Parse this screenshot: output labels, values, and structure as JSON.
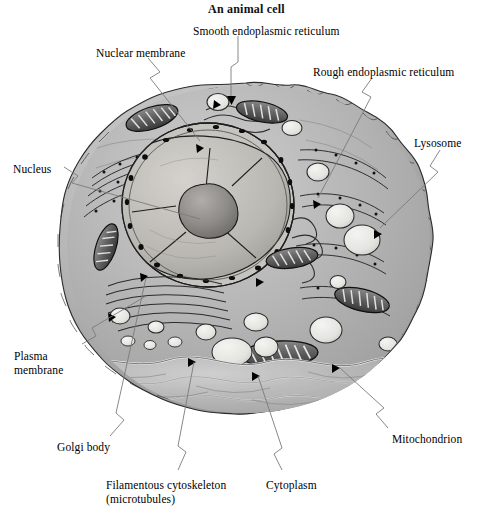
{
  "figure": {
    "title": "An animal cell",
    "style": "grayscale pen-and-ink cutaway illustration",
    "background_color": "#ffffff",
    "ink_color": "#000000",
    "leader_line_color": "#7b7b7b"
  },
  "labels": [
    {
      "id": "nuclear-membrane",
      "text": "Nuclear membrane",
      "lines": [
        "Nuclear membrane"
      ],
      "x": 96,
      "y": 47,
      "align": "left"
    },
    {
      "id": "smooth-er",
      "text": "Smooth endoplasmic reticulum",
      "lines": [
        "Smooth endoplasmic reticulum"
      ],
      "x": 193,
      "y": 25,
      "align": "left"
    },
    {
      "id": "rough-er",
      "text": "Rough endoplasmic reticulum",
      "lines": [
        "Rough endoplasmic reticulum"
      ],
      "x": 313,
      "y": 66,
      "align": "left"
    },
    {
      "id": "lysosome",
      "text": "Lysosome",
      "lines": [
        "Lysosome"
      ],
      "x": 414,
      "y": 137,
      "align": "left"
    },
    {
      "id": "nucleus",
      "text": "Nucleus",
      "lines": [
        "Nucleus"
      ],
      "x": 13,
      "y": 163,
      "align": "left"
    },
    {
      "id": "plasma-membrane",
      "text": "Plasma membrane",
      "lines": [
        "Plasma",
        "membrane"
      ],
      "x": 14,
      "y": 350,
      "align": "left"
    },
    {
      "id": "golgi-body",
      "text": "Golgi body",
      "lines": [
        "Golgi body"
      ],
      "x": 57,
      "y": 441,
      "align": "left"
    },
    {
      "id": "filamentous-cytoskeleton",
      "text": "Filamentous cytoskeleton (microtubules)",
      "lines": [
        "Filamentous cytoskeleton",
        "(microtubules)"
      ],
      "x": 106,
      "y": 479,
      "align": "left"
    },
    {
      "id": "cytoplasm",
      "text": "Cytoplasm",
      "lines": [
        "Cytoplasm"
      ],
      "x": 266,
      "y": 479,
      "align": "left"
    },
    {
      "id": "mitochondrion",
      "text": "Mitochondrion",
      "lines": [
        "Mitochondrion"
      ],
      "x": 392,
      "y": 433,
      "align": "left"
    }
  ],
  "structures": [
    {
      "id": "plasma-membrane",
      "name": "Plasma membrane",
      "note": "wavy bumpy outer boundary"
    },
    {
      "id": "cytoplasm",
      "name": "Cytoplasm",
      "note": "shaded interior ground substance"
    },
    {
      "id": "nucleus",
      "name": "Nucleus",
      "note": "large cut-open sphere, upper left of centre"
    },
    {
      "id": "nucleolus",
      "name": "Nucleolus",
      "note": "dark blob inside nucleus"
    },
    {
      "id": "nuclear-membrane",
      "name": "Nuclear membrane",
      "note": "double membrane with dark pores"
    },
    {
      "id": "rough-er",
      "name": "Rough endoplasmic reticulum",
      "note": "stacked membranes studded with ribosomes"
    },
    {
      "id": "smooth-er",
      "name": "Smooth endoplasmic reticulum",
      "note": "tubular membranes without ribosomes"
    },
    {
      "id": "golgi-body",
      "name": "Golgi body",
      "note": "flattened stacked cisternae, left of centre"
    },
    {
      "id": "mitochondrion",
      "name": "Mitochondrion",
      "note": "oval organelles with internal cristae"
    },
    {
      "id": "lysosome",
      "name": "Lysosome",
      "note": "pale round vesicles"
    },
    {
      "id": "filamentous-cytoskeleton",
      "name": "Filamentous cytoskeleton (microtubules)",
      "note": "fine filaments in cytoplasm"
    }
  ]
}
